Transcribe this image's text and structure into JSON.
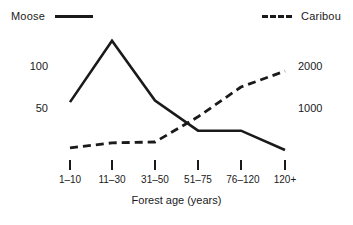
{
  "chart_data": {
    "type": "line",
    "title": "",
    "xlabel": "Forest age (years)",
    "ylabel": "",
    "categories": [
      "1–10",
      "11–30",
      "31–50",
      "51–75",
      "76–120",
      "120+"
    ],
    "grid": false,
    "legend_position": "top",
    "axes": {
      "left": {
        "label": "",
        "ticks": [
          50,
          100
        ],
        "tick_labels": [
          "50",
          "100"
        ],
        "range": [
          0,
          130
        ]
      },
      "right": {
        "label": "",
        "ticks": [
          1000,
          2000
        ],
        "tick_labels": [
          "1000",
          "2000"
        ],
        "range": [
          0,
          2500
        ]
      }
    },
    "series": [
      {
        "name": "Moose",
        "axis": "left",
        "style": "solid",
        "color": "#1a1a1a",
        "values": [
          57,
          130,
          59,
          23,
          23,
          0
        ]
      },
      {
        "name": "Caribou",
        "axis": "right",
        "style": "dashed",
        "color": "#1a1a1a",
        "values": [
          50,
          170,
          190,
          790,
          1500,
          1880
        ]
      }
    ]
  },
  "legend": {
    "moose_label": "Moose",
    "caribou_label": "Caribou"
  },
  "axis_left": {
    "tick_100": "100",
    "tick_50": "50"
  },
  "axis_right": {
    "tick_2000": "2000",
    "tick_1000": "1000"
  },
  "x_axis": {
    "title": "Forest age (years)",
    "cat_0": "1–10",
    "cat_1": "11–30",
    "cat_2": "31–50",
    "cat_3": "51–75",
    "cat_4": "76–120",
    "cat_5": "120+"
  }
}
